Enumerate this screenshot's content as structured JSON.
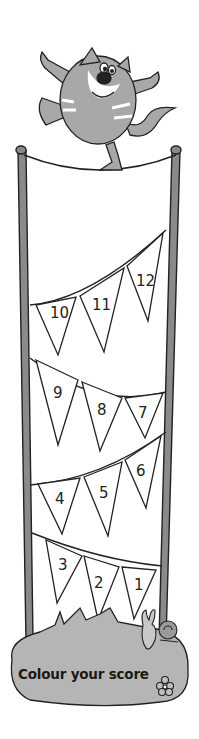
{
  "scene": {
    "title": "Colour your score",
    "colors": {
      "pole": "#8a8a8a",
      "cat_body": "#a8a8a8",
      "grass": "#b5b5b5",
      "outline": "#222222",
      "background": "#ffffff"
    }
  },
  "bunting": {
    "rows": [
      {
        "flags": [
          {
            "label": "10"
          },
          {
            "label": "11"
          },
          {
            "label": "12"
          }
        ]
      },
      {
        "flags": [
          {
            "label": "9"
          },
          {
            "label": "8"
          },
          {
            "label": "7"
          }
        ]
      },
      {
        "flags": [
          {
            "label": "4"
          },
          {
            "label": "5"
          },
          {
            "label": "6"
          }
        ]
      },
      {
        "flags": [
          {
            "label": "3"
          },
          {
            "label": "2"
          },
          {
            "label": "1"
          }
        ]
      }
    ]
  },
  "caption": {
    "text": "Colour your score"
  }
}
